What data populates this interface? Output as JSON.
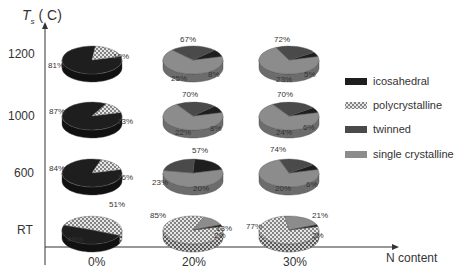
{
  "chart_data": {
    "type": "pie",
    "title": "",
    "ylabel": "Ts ( C)",
    "ylabel_main": "T",
    "ylabel_sub": "s",
    "ylabel_unit": "( C)",
    "xlabel": "N content",
    "x_categories": [
      "0%",
      "20%",
      "30%"
    ],
    "y_categories": [
      "1200",
      "1000",
      "600",
      "RT"
    ],
    "legend": [
      {
        "name": "icosahedral",
        "color": "#1e1e1e",
        "pattern": "solid"
      },
      {
        "name": "polycrystalline",
        "color": "#d8d8d8",
        "pattern": "dots"
      },
      {
        "name": "twinned",
        "color": "#4a4a4a",
        "pattern": "solid"
      },
      {
        "name": "single crystalline",
        "color": "#8c8c8c",
        "pattern": "solid"
      }
    ],
    "pies": [
      {
        "temp": "1200",
        "n": "0%",
        "slices": {
          "icosahedral": 81,
          "polycrystalline": 19
        }
      },
      {
        "temp": "1200",
        "n": "20%",
        "slices": {
          "single crystalline": 67,
          "twinned": 25,
          "icosahedral": 8
        }
      },
      {
        "temp": "1200",
        "n": "30%",
        "slices": {
          "single crystalline": 72,
          "twinned": 23,
          "icosahedral": 5
        }
      },
      {
        "temp": "1000",
        "n": "0%",
        "slices": {
          "icosahedral": 87,
          "polycrystalline": 13
        }
      },
      {
        "temp": "1000",
        "n": "20%",
        "slices": {
          "single crystalline": 70,
          "twinned": 22,
          "icosahedral": 8
        }
      },
      {
        "temp": "1000",
        "n": "30%",
        "slices": {
          "single crystalline": 70,
          "twinned": 24,
          "icosahedral": 6
        }
      },
      {
        "temp": "600",
        "n": "0%",
        "slices": {
          "icosahedral": 84,
          "polycrystalline": 16
        }
      },
      {
        "temp": "600",
        "n": "20%",
        "slices": {
          "single crystalline": 57,
          "twinned": 23,
          "icosahedral": 20
        }
      },
      {
        "temp": "600",
        "n": "30%",
        "slices": {
          "single crystalline": 74,
          "twinned": 20,
          "icosahedral": 6
        }
      },
      {
        "temp": "RT",
        "n": "0%",
        "slices": {
          "polycrystalline": 51,
          "icosahedral": 49
        }
      },
      {
        "temp": "RT",
        "n": "20%",
        "slices": {
          "polycrystalline": 85,
          "single crystalline": 13,
          "icosahedral": 2
        }
      },
      {
        "temp": "RT",
        "n": "30%",
        "slices": {
          "polycrystalline": 77,
          "single crystalline": 21,
          "icosahedral": 2
        }
      }
    ],
    "labels": [
      {
        "text": "81%",
        "x": 48,
        "y": 68
      },
      {
        "text": "19%",
        "x": 113,
        "y": 59
      },
      {
        "text": "67%",
        "x": 180,
        "y": 42
      },
      {
        "text": "25%",
        "x": 171,
        "y": 81
      },
      {
        "text": "8%",
        "x": 208,
        "y": 77
      },
      {
        "text": "72%",
        "x": 274,
        "y": 42
      },
      {
        "text": "23%",
        "x": 276,
        "y": 82
      },
      {
        "text": "5%",
        "x": 304,
        "y": 77
      },
      {
        "text": "87%",
        "x": 49,
        "y": 114
      },
      {
        "text": "13%",
        "x": 117,
        "y": 124
      },
      {
        "text": "70%",
        "x": 182,
        "y": 97
      },
      {
        "text": "22%",
        "x": 175,
        "y": 135
      },
      {
        "text": "8%",
        "x": 210,
        "y": 131
      },
      {
        "text": "70%",
        "x": 277,
        "y": 97
      },
      {
        "text": "24%",
        "x": 276,
        "y": 135
      },
      {
        "text": "6%",
        "x": 303,
        "y": 130
      },
      {
        "text": "84%",
        "x": 49,
        "y": 171
      },
      {
        "text": "16%",
        "x": 117,
        "y": 180
      },
      {
        "text": "57%",
        "x": 192,
        "y": 153
      },
      {
        "text": "23%",
        "x": 152,
        "y": 185
      },
      {
        "text": "20%",
        "x": 193,
        "y": 191
      },
      {
        "text": "74%",
        "x": 270,
        "y": 152
      },
      {
        "text": "20%",
        "x": 275,
        "y": 191
      },
      {
        "text": "6%",
        "x": 306,
        "y": 187
      },
      {
        "text": "51%",
        "x": 109,
        "y": 207
      },
      {
        "text": "49%",
        "x": 67,
        "y": 242
      },
      {
        "text": "85%",
        "x": 150,
        "y": 218
      },
      {
        "text": "13%",
        "x": 216,
        "y": 231
      },
      {
        "text": "2%",
        "x": 214,
        "y": 238
      },
      {
        "text": "77%",
        "x": 246,
        "y": 229
      },
      {
        "text": "21%",
        "x": 312,
        "y": 218
      },
      {
        "text": "2%",
        "x": 312,
        "y": 238
      }
    ]
  }
}
